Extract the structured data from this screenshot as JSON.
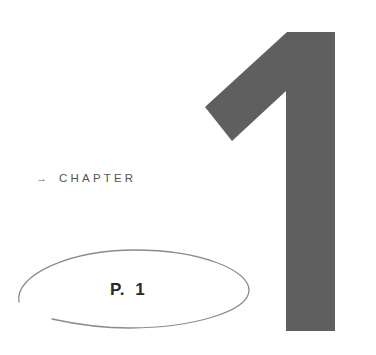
{
  "chapter": {
    "arrow_icon": "→",
    "label": "CHAPTER",
    "number": "1",
    "number_color": "#5f5f5f"
  },
  "page": {
    "label": "P.  1",
    "ellipse_stroke_color": "#8c8c8c"
  }
}
